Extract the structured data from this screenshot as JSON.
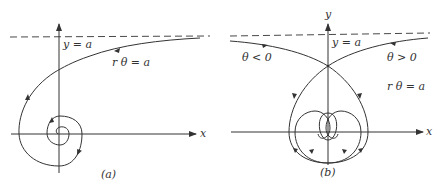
{
  "panel_a": {
    "caption": "(a)",
    "x_axis_label": "x",
    "asymptote_label": "y = a",
    "curve_label": "r θ = a"
  },
  "panel_b": {
    "caption": "(b)",
    "x_axis_label": "x",
    "y_axis_label": "y",
    "asymptote_label": "y = a",
    "curve_label": "r θ = a",
    "branch_negative_label": "θ < 0",
    "branch_positive_label": "θ > 0"
  },
  "colors": {
    "stroke": "#333333",
    "background": "#ffffff"
  }
}
